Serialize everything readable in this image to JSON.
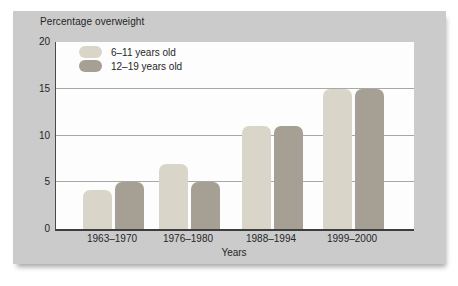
{
  "panel": {
    "background_color": "#cbcbcb",
    "plot_background_color": "#fdfdfd",
    "gridline_color": "#a8a8a8",
    "axis_color": "#3d3d3d",
    "text_color": "#262626"
  },
  "chart_data": {
    "type": "bar",
    "title": "Percentage overweight",
    "xlabel": "Years",
    "ylabel": "",
    "categories": [
      "1963–1970",
      "1976–1980",
      "1988–1994",
      "1999–2000"
    ],
    "series": [
      {
        "name": "6–11 years old",
        "color": "#d9d6c9",
        "values": [
          4.2,
          7,
          11,
          15
        ]
      },
      {
        "name": "12–19 years old",
        "color": "#a6a094",
        "values": [
          5,
          5,
          11,
          15
        ]
      }
    ],
    "ylim": [
      0,
      20
    ],
    "y_ticks": [
      0,
      5,
      10,
      15,
      20
    ],
    "gridlines": [
      5,
      10,
      15
    ],
    "grid": true,
    "legend_position": "inside top-left"
  }
}
